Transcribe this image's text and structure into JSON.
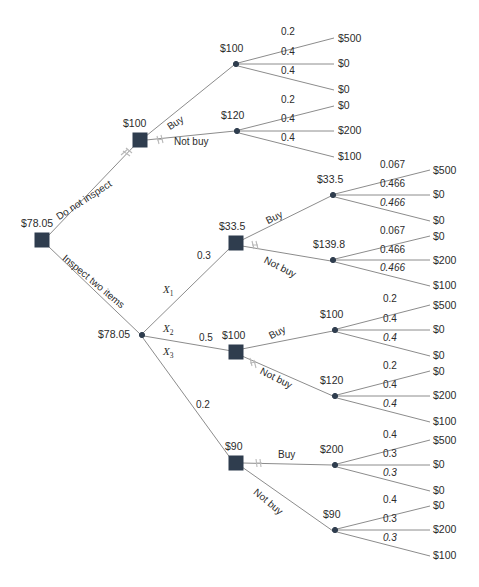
{
  "diagram": {
    "type": "decision-tree",
    "colors": {
      "node": "#2f3d4e",
      "line": "#8c8c8c",
      "text": "#2b2b2b",
      "background": "#ffffff"
    },
    "root": {
      "value": "$78.05",
      "actions": {
        "do_not_inspect": "Do not inspect",
        "inspect": "Inspect two items"
      }
    },
    "branch_do_not_inspect": {
      "decision_value": "$100",
      "actions": {
        "buy": "Buy",
        "not_buy": "Not buy"
      },
      "buy": {
        "node_value": "$100",
        "probs": [
          "0.2",
          "0.4",
          "0.4"
        ],
        "outcomes": [
          "$500",
          "$0",
          "$0"
        ]
      },
      "not_buy": {
        "node_value": "$120",
        "probs": [
          "0.2",
          "0.4",
          "0.4"
        ],
        "outcomes": [
          "$0",
          "$200",
          "$100"
        ]
      }
    },
    "branch_inspect": {
      "chance_value": "$78.05",
      "outcome_vars": [
        "X",
        "X",
        "X"
      ],
      "outcome_var_subs": [
        "1",
        "2",
        "3"
      ],
      "outcome_probs": [
        "0.3",
        "0.5",
        "0.2"
      ],
      "sub_x1": {
        "decision_value": "$33.5",
        "actions": {
          "buy": "Buy",
          "not_buy": "Not buy"
        },
        "buy": {
          "node_value": "$33.5",
          "probs": [
            "0.067",
            "0.466",
            "0.466"
          ],
          "outcomes": [
            "$500",
            "$0",
            "$0"
          ]
        },
        "not_buy": {
          "node_value": "$139.8",
          "probs": [
            "0.067",
            "0.466",
            "0.466"
          ],
          "outcomes": [
            "$0",
            "$200",
            "$100"
          ]
        }
      },
      "sub_x2": {
        "decision_value": "$100",
        "actions": {
          "buy": "Buy",
          "not_buy": "Not buy"
        },
        "buy": {
          "node_value": "$100",
          "probs": [
            "0.2",
            "0.4",
            "0.4"
          ],
          "outcomes": [
            "$500",
            "$0",
            "$0"
          ]
        },
        "not_buy": {
          "node_value": "$120",
          "probs": [
            "0.2",
            "0.4",
            "0.4"
          ],
          "outcomes": [
            "$0",
            "$200",
            "$100"
          ]
        }
      },
      "sub_x3": {
        "decision_value": "$90",
        "actions": {
          "buy": "Buy",
          "not_buy": "Not buy"
        },
        "buy": {
          "node_value": "$200",
          "probs": [
            "0.4",
            "0.3",
            "0.3"
          ],
          "outcomes": [
            "$500",
            "$0",
            "$0"
          ]
        },
        "not_buy": {
          "node_value": "$90",
          "probs": [
            "0.4",
            "0.3",
            "0.3"
          ],
          "outcomes": [
            "$0",
            "$200",
            "$100"
          ]
        }
      }
    }
  }
}
